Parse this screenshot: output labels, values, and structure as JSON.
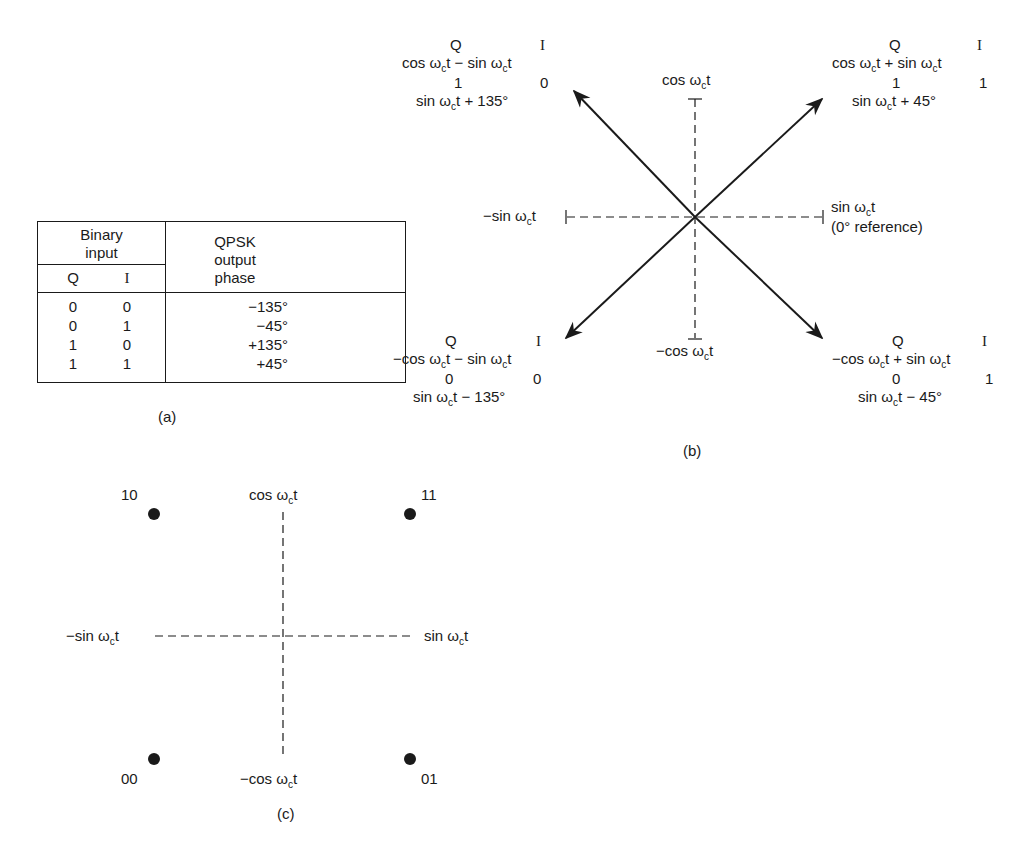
{
  "figure_a": {
    "caption": "(a)",
    "table": {
      "header_group": "Binary input",
      "header_group_line1": "Binary",
      "header_group_line2": "input",
      "col_q": "Q",
      "col_i": "I",
      "col_phase_line1": "QPSK",
      "col_phase_line2": "output",
      "col_phase_line3": "phase",
      "rows": [
        {
          "q": "0",
          "i": "0",
          "phase": "−135°"
        },
        {
          "q": "0",
          "i": "1",
          "phase": "−45°"
        },
        {
          "q": "1",
          "i": "0",
          "phase": "+135°"
        },
        {
          "q": "1",
          "i": "1",
          "phase": "+45°"
        }
      ]
    }
  },
  "figure_b": {
    "caption": "(b)",
    "axes": {
      "top": {
        "prefix": "cos ω",
        "sub": "c",
        "suffix": "t"
      },
      "bottom": {
        "prefix": "−cos ω",
        "sub": "c",
        "suffix": "t"
      },
      "left": {
        "prefix": "−sin ω",
        "sub": "c",
        "suffix": "t"
      },
      "right": {
        "prefix": "sin ω",
        "sub": "c",
        "suffix": "t",
        "note": "(0° reference)"
      }
    },
    "phasors": [
      {
        "position": "upper-left",
        "q": "Q",
        "i": "I",
        "expr_a": "cos ω",
        "expr_b": "t − sin ω",
        "expr_c": "t",
        "bit_q": "1",
        "bit_i": "0",
        "result_a": "sin ω",
        "result_b": "t + 135°"
      },
      {
        "position": "upper-right",
        "q": "Q",
        "i": "I",
        "expr_a": "cos ω",
        "expr_b": "t + sin ω",
        "expr_c": "t",
        "bit_q": "1",
        "bit_i": "1",
        "result_a": "sin ω",
        "result_b": "t + 45°"
      },
      {
        "position": "lower-left",
        "q": "Q",
        "i": "I",
        "expr_a": "−cos ω",
        "expr_b": "t − sin ω",
        "expr_c": "t",
        "bit_q": "0",
        "bit_i": "0",
        "result_a": "sin ω",
        "result_b": "t − 135°"
      },
      {
        "position": "lower-right",
        "q": "Q",
        "i": "I",
        "expr_a": "−cos ω",
        "expr_b": "t + sin ω",
        "expr_c": "t",
        "bit_q": "0",
        "bit_i": "1",
        "result_a": "sin ω",
        "result_b": "t − 45°"
      }
    ],
    "subscript": "c"
  },
  "figure_c": {
    "caption": "(c)",
    "axes": {
      "top": {
        "prefix": "cos ω",
        "sub": "c",
        "suffix": "t"
      },
      "bottom": {
        "prefix": "−cos ω",
        "sub": "c",
        "suffix": "t"
      },
      "left": {
        "prefix": "−sin ω",
        "sub": "c",
        "suffix": "t"
      },
      "right": {
        "prefix": "sin ω",
        "sub": "c",
        "suffix": "t"
      }
    },
    "points": [
      {
        "label": "10",
        "position": "upper-left"
      },
      {
        "label": "11",
        "position": "upper-right"
      },
      {
        "label": "00",
        "position": "lower-left"
      },
      {
        "label": "01",
        "position": "lower-right"
      }
    ]
  },
  "colors": {
    "ink": "#1a1a1a",
    "background": "#ffffff"
  }
}
